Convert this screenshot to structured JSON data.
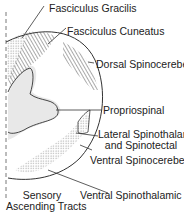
{
  "diagram": {
    "title": "Sensory Ascending Tracts",
    "title_lines": [
      "Sensory",
      "Ascending Tracts"
    ],
    "labels": {
      "fasciculus_gracilis": "Fasciculus Gracilis",
      "fasciculus_cuneatus": "Fasciculus Cuneatus",
      "dorsal_spinocerebellar": "Dorsal Spinocerebellar",
      "propriospinal": "Propriospinal",
      "lateral_spinothalamic_line1": "Lateral Spinothalamic",
      "lateral_spinothalamic_line2": "and Spinotectal",
      "ventral_spinocerebellar": "Ventral Spinocerebellar",
      "ventral_spinothalamic": "Ventral Spinothalamic"
    },
    "colors": {
      "outline": "#333333",
      "gray_matter": "#e6e6e6",
      "hatch": "#555555",
      "stipple": "#777777"
    }
  }
}
